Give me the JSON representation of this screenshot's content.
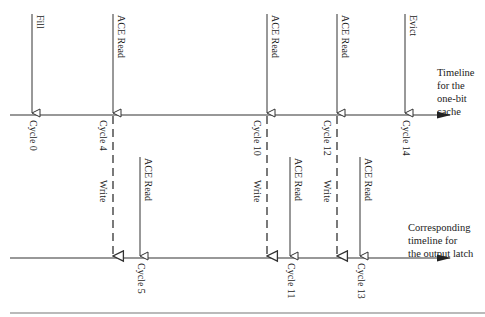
{
  "cache_timeline": {
    "label_lines": [
      "Timeline",
      "for the",
      "one-bit",
      "cache"
    ],
    "events": [
      {
        "name": "fill",
        "label": "Fill",
        "cycle_label": "Cycle 0"
      },
      {
        "name": "ace-read-4",
        "label": "ACE Read",
        "cycle_label": "Cycle 4"
      },
      {
        "name": "ace-read-10",
        "label": "ACE Read",
        "cycle_label": "Cycle 10"
      },
      {
        "name": "ace-read-12",
        "label": "ACE Read",
        "cycle_label": "Cycle 12"
      },
      {
        "name": "evict",
        "label": "Evict",
        "cycle_label": "Cycle 14"
      }
    ]
  },
  "latch_timeline": {
    "label_lines": [
      "Corresponding",
      "timeline for",
      "the output latch"
    ],
    "writes": [
      {
        "label": "Write",
        "from_cycle": "Cycle 4"
      },
      {
        "label": "Write",
        "from_cycle": "Cycle 10"
      },
      {
        "label": "Write",
        "from_cycle": "Cycle 12"
      }
    ],
    "reads": [
      {
        "label": "ACE Read",
        "cycle_label": "Cycle 5"
      },
      {
        "label": "ACE Read",
        "cycle_label": "Cycle 11"
      },
      {
        "label": "ACE Read",
        "cycle_label": "Cycle 13"
      }
    ]
  }
}
